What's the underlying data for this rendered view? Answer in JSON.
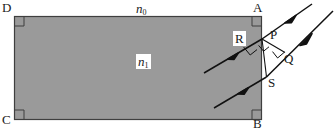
{
  "figure": {
    "type": "optics-refraction-diagram",
    "canvas": {
      "width": 334,
      "height": 132
    },
    "colors": {
      "slab_fill": "#9a9a9a",
      "outline": "#3a3a3a",
      "ray": "#111111",
      "label": "#1a1a1a",
      "background": "#ffffff"
    },
    "slab": {
      "name": "rectangular-medium",
      "x": 14,
      "y": 16,
      "width": 248,
      "height": 104,
      "corner_labels": {
        "top_left": "D",
        "top_right": "A",
        "bottom_left": "C",
        "bottom_right": "B"
      },
      "right_angle_marks": 4
    },
    "labels": {
      "outside_medium": {
        "text": "n",
        "sub": "0",
        "x": 136,
        "y": 3
      },
      "inside_medium": {
        "text": "n",
        "sub": "1",
        "x": 139,
        "y": 57
      },
      "wavefront_inside": {
        "text": "R",
        "x": 235,
        "y": 33
      },
      "point_p": {
        "text": "P",
        "x": 272,
        "y": 31
      },
      "point_q": {
        "text": "Q",
        "x": 283,
        "y": 55
      },
      "point_s": {
        "text": "S",
        "x": 268,
        "y": 78
      },
      "corner_a": {
        "text": "A",
        "x": 255,
        "y": 2
      },
      "corner_b": {
        "text": "B",
        "x": 255,
        "y": 117
      },
      "corner_c": {
        "text": "C",
        "x": 3,
        "y": 114
      },
      "corner_d": {
        "text": "D",
        "x": 3,
        "y": 2
      }
    },
    "rays": [
      {
        "name": "internal-ray-upper",
        "from": [
          205,
          72
        ],
        "to": [
          262,
          39
        ],
        "arrow_at": 0.55
      },
      {
        "name": "internal-ray-lower",
        "from": [
          215,
          107
        ],
        "to": [
          266,
          77
        ],
        "arrow_at": 0.6
      },
      {
        "name": "exit-ray-upper",
        "from": [
          262,
          39
        ],
        "to": [
          310,
          5
        ],
        "arrow_at": 0.62
      },
      {
        "name": "exit-ray-lower",
        "from": [
          266,
          77
        ],
        "to": [
          330,
          12
        ],
        "arrow_at": 0.55
      }
    ],
    "segments": [
      {
        "name": "wavefront-PS-inside",
        "from": [
          262,
          39
        ],
        "to": [
          266,
          77
        ]
      },
      {
        "name": "wavefront-PQ-outside",
        "from": [
          262,
          39
        ],
        "to": [
          285,
          52
        ]
      }
    ],
    "angle_marks": [
      {
        "name": "right-angle-at-R",
        "vertex": [
          248,
          48
        ]
      },
      {
        "name": "right-angle-at-P",
        "vertex": [
          266,
          41
        ]
      },
      {
        "name": "right-angle-at-Q",
        "vertex": [
          280,
          52
        ]
      }
    ]
  }
}
